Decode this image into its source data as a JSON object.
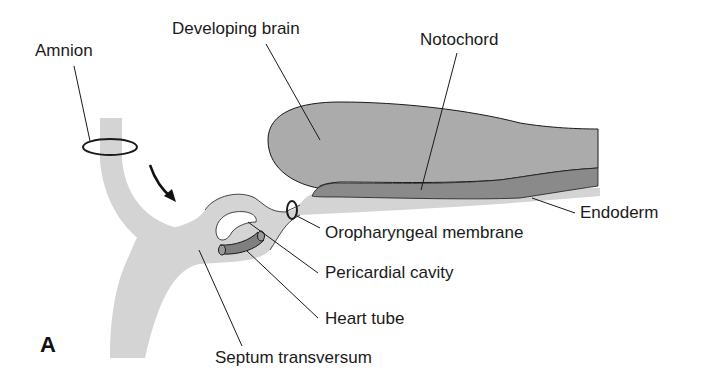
{
  "figure": {
    "panel_letter": "A",
    "colors": {
      "ectoderm_light": "#d4d4d4",
      "brain_mid": "#ababab",
      "notochord_dark": "#8a8a8a",
      "heart_tube": "#7f7f7f",
      "outline": "#1a1a1a",
      "background": "#ffffff"
    },
    "labels": {
      "amnion": "Amnion",
      "developing_brain": "Developing brain",
      "notochord": "Notochord",
      "endoderm": "Endoderm",
      "oropharyngeal_membrane": "Oropharyngeal membrane",
      "pericardial_cavity": "Pericardial cavity",
      "heart_tube": "Heart tube",
      "septum_transversum": "Septum transversum"
    },
    "icons": {
      "folding_arrow": "curved-arrow-down-right"
    }
  }
}
